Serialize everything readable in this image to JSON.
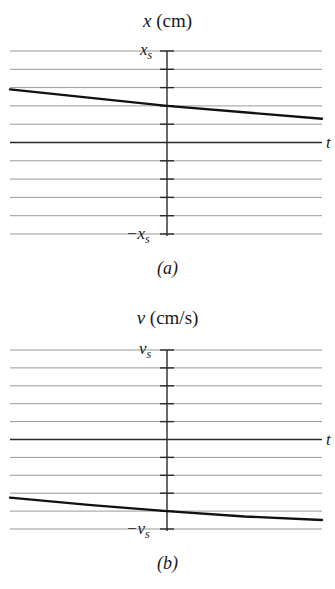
{
  "chart_data": [
    {
      "type": "line",
      "panel": "a",
      "title": "x (cm)",
      "title_var": "x",
      "title_unit": "(cm)",
      "caption": "(a)",
      "xlabel": "t",
      "ylabel": "x (cm)",
      "y_tick_labels": {
        "top": "x",
        "top_sub": "s",
        "bottom": "−x",
        "bottom_sub": "s"
      },
      "ylim": [
        -1,
        1
      ],
      "y_units": "fraction of x_s",
      "gridlines": 11,
      "grid": true,
      "x": [
        -1,
        0,
        1
      ],
      "series": [
        {
          "name": "x(t)",
          "values": [
            0.58,
            0.4,
            0.26
          ]
        }
      ]
    },
    {
      "type": "line",
      "panel": "b",
      "title": "v (cm/s)",
      "title_var": "v",
      "title_unit": "(cm/s)",
      "caption": "(b)",
      "xlabel": "t",
      "ylabel": "v (cm/s)",
      "y_tick_labels": {
        "top": "v",
        "top_sub": "s",
        "bottom": "−v",
        "bottom_sub": "s"
      },
      "ylim": [
        -1,
        1
      ],
      "y_units": "fraction of v_s",
      "gridlines": 11,
      "grid": true,
      "x": [
        -1,
        -0.5,
        0,
        0.5,
        1
      ],
      "series": [
        {
          "name": "v(t)",
          "values": [
            -0.65,
            -0.73,
            -0.8,
            -0.86,
            -0.9
          ]
        }
      ]
    }
  ],
  "colors": {
    "grid": "#9a9a9a",
    "axis": "#2a2a2a",
    "curve": "#111111",
    "text": "#1a1a1a"
  }
}
